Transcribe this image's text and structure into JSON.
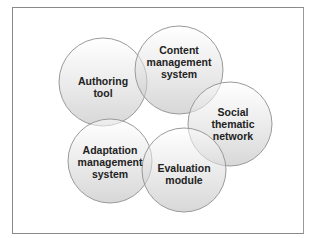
{
  "diagram": {
    "type": "overlapping-circles",
    "nodes": [
      {
        "id": "authoring",
        "label_lines": [
          "Authoring",
          "tool"
        ],
        "cx": 103,
        "cy": 82,
        "r": 44
      },
      {
        "id": "cms",
        "label_lines": [
          "Content",
          "management",
          "system"
        ],
        "cx": 179,
        "cy": 70,
        "r": 44
      },
      {
        "id": "social",
        "label_lines": [
          "Social",
          "thematic",
          "network"
        ],
        "cx": 230,
        "cy": 124,
        "r": 42
      },
      {
        "id": "adaptation",
        "label_lines": [
          "Adaptation",
          "management",
          "system"
        ],
        "cx": 110,
        "cy": 161,
        "r": 42
      },
      {
        "id": "evaluation",
        "label_lines": [
          "Evaluation",
          "module"
        ],
        "cx": 184,
        "cy": 170,
        "r": 42
      }
    ],
    "colors": {
      "circle_fill_top": "#ffffff",
      "circle_fill_bottom": "#cfcfcf",
      "circle_stroke": "#9a9a9a",
      "text": "#222222",
      "frame": "#8a8a8a"
    }
  }
}
